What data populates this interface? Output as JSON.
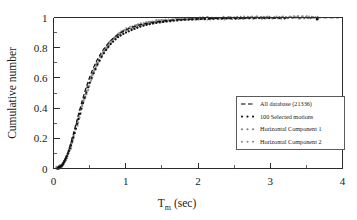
{
  "figure": {
    "name": "cumulative-distribution-tm",
    "background": "#ffffff"
  },
  "axes": {
    "x_title_main": "T",
    "x_title_sub": "m",
    "x_title_unit": " (sec)",
    "y_title": "Cumulative number",
    "x_ticks": [
      "0",
      "1",
      "2",
      "3",
      "4"
    ],
    "y_ticks": [
      "0",
      "0.2",
      "0.4",
      "0.6",
      "0.8",
      "1"
    ]
  },
  "legend": {
    "items": [
      {
        "label": "All database (21336)",
        "marker": "dashed-line",
        "color": "#111111"
      },
      {
        "label": "100 Selected motions",
        "marker": "dotted-line",
        "color": "#111111"
      },
      {
        "label": "Horizontal Component 1",
        "marker": "dotted-line",
        "color": "#7d7d7d"
      },
      {
        "label": "Horizontal Component 2",
        "marker": "dotted-line",
        "color": "#8d8d8d"
      }
    ]
  },
  "chart_data": {
    "type": "line",
    "title": "",
    "xlabel": "Tm (sec)",
    "ylabel": "Cumulative number",
    "xlim": [
      0,
      4
    ],
    "ylim": [
      0,
      1
    ],
    "x_major_ticks": [
      0,
      1,
      2,
      3,
      4
    ],
    "x_minor_step": 0.5,
    "y_major_ticks": [
      0,
      0.2,
      0.4,
      0.6,
      0.8,
      1
    ],
    "y_minor_step": 0.1,
    "grid": false,
    "legend_position": "center-right",
    "series": [
      {
        "name": "All database (21336)",
        "style": "dashed",
        "color": "#111111",
        "x": [
          0.05,
          0.1,
          0.15,
          0.2,
          0.25,
          0.3,
          0.35,
          0.4,
          0.45,
          0.5,
          0.55,
          0.6,
          0.65,
          0.7,
          0.75,
          0.8,
          0.85,
          0.9,
          0.95,
          1.0,
          1.1,
          1.2,
          1.3,
          1.4,
          1.5,
          1.6,
          1.8,
          2.0,
          2.5,
          3.0,
          3.65,
          4.0
        ],
        "y": [
          0.0,
          0.01,
          0.045,
          0.105,
          0.185,
          0.275,
          0.365,
          0.455,
          0.535,
          0.605,
          0.665,
          0.715,
          0.758,
          0.795,
          0.826,
          0.851,
          0.872,
          0.89,
          0.905,
          0.918,
          0.938,
          0.952,
          0.962,
          0.97,
          0.976,
          0.981,
          0.987,
          0.991,
          0.996,
          0.998,
          0.999,
          1.0
        ]
      },
      {
        "name": "100 Selected motions",
        "style": "dotted",
        "color": "#111111",
        "x": [
          0.06,
          0.12,
          0.18,
          0.24,
          0.3,
          0.36,
          0.42,
          0.48,
          0.54,
          0.6,
          0.66,
          0.72,
          0.78,
          0.84,
          0.9,
          0.96,
          1.02,
          1.08,
          1.16,
          1.24,
          1.32,
          1.42,
          1.52,
          1.62,
          1.74,
          1.86,
          2.0,
          2.2,
          2.45,
          2.75,
          3.1,
          3.65
        ],
        "y": [
          0.002,
          0.02,
          0.075,
          0.15,
          0.25,
          0.35,
          0.452,
          0.54,
          0.615,
          0.68,
          0.735,
          0.78,
          0.818,
          0.848,
          0.872,
          0.89,
          0.904,
          0.917,
          0.932,
          0.945,
          0.955,
          0.964,
          0.971,
          0.977,
          0.982,
          0.986,
          0.989,
          0.992,
          0.994,
          0.996,
          0.997,
          0.99
        ]
      },
      {
        "name": "Horizontal Component 1",
        "style": "dotted",
        "color": "#7d7d7d",
        "x": [
          0.05,
          0.11,
          0.17,
          0.23,
          0.29,
          0.35,
          0.41,
          0.47,
          0.53,
          0.59,
          0.65,
          0.71,
          0.77,
          0.83,
          0.89,
          0.95,
          1.01,
          1.08,
          1.16,
          1.25,
          1.34,
          1.44,
          1.55,
          1.68,
          1.82,
          2.0,
          2.3,
          2.7,
          3.2,
          3.65
        ],
        "y": [
          0.0,
          0.015,
          0.062,
          0.135,
          0.232,
          0.338,
          0.442,
          0.532,
          0.612,
          0.678,
          0.735,
          0.782,
          0.822,
          0.855,
          0.882,
          0.902,
          0.918,
          0.932,
          0.946,
          0.957,
          0.966,
          0.973,
          0.979,
          0.984,
          0.988,
          0.991,
          0.994,
          0.996,
          0.998,
          0.999
        ]
      },
      {
        "name": "Horizontal Component 2",
        "style": "dotted",
        "color": "#8d8d8d",
        "x": [
          0.05,
          0.11,
          0.17,
          0.23,
          0.29,
          0.35,
          0.41,
          0.47,
          0.53,
          0.59,
          0.65,
          0.71,
          0.77,
          0.83,
          0.89,
          0.95,
          1.01,
          1.09,
          1.18,
          1.28,
          1.38,
          1.5,
          1.64,
          1.8,
          2.0,
          2.35,
          2.8,
          3.3,
          3.65
        ],
        "y": [
          0.0,
          0.012,
          0.055,
          0.125,
          0.222,
          0.328,
          0.432,
          0.524,
          0.606,
          0.674,
          0.732,
          0.78,
          0.82,
          0.853,
          0.88,
          0.901,
          0.917,
          0.933,
          0.947,
          0.958,
          0.967,
          0.974,
          0.98,
          0.985,
          0.989,
          0.993,
          0.996,
          0.998,
          0.999
        ]
      }
    ],
    "outlier_point": {
      "x": 3.65,
      "y": 0.99
    }
  }
}
